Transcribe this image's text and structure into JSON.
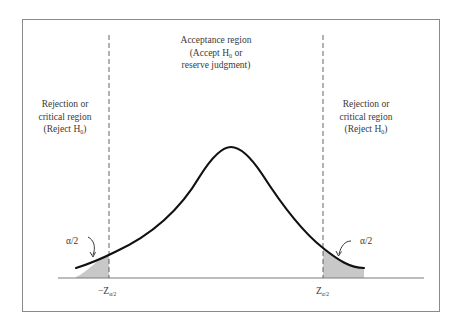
{
  "diagram": {
    "acceptance_region": {
      "line1": "Acceptance region",
      "line2_prefix": "(Accept H",
      "line2_sub": "0",
      "line2_suffix": " or",
      "line3": "reserve judgment)"
    },
    "left_rejection_region": {
      "line1": "Rejection or",
      "line2": "critical region",
      "line3_prefix": "(Reject H",
      "line3_sub": "0",
      "line3_suffix": ")"
    },
    "right_rejection_region": {
      "line1": "Rejection or",
      "line2": "critical region",
      "line3_prefix": "(Reject H",
      "line3_sub": "0",
      "line3_suffix": ")"
    },
    "left_tail_label": "α/2",
    "right_tail_label": "α/2",
    "left_critical_value": {
      "main": "−Z",
      "sub": "α/2"
    },
    "right_critical_value": {
      "main": "Z",
      "sub": "α/2"
    },
    "colors": {
      "curve": "#111111",
      "tail_fill": "#c8c8c8",
      "axis": "#7a7a7a",
      "dashed": "#555555",
      "frame": "#8a8a8a",
      "text": "#3a3a3a"
    }
  }
}
